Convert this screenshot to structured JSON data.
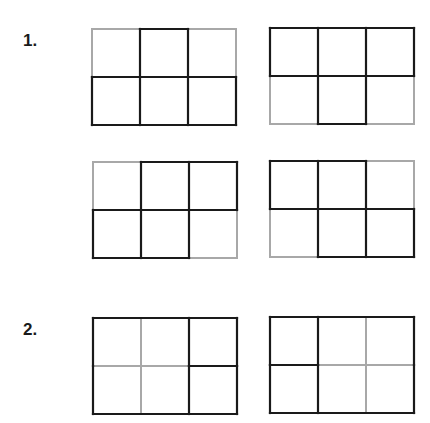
{
  "colors": {
    "dark": "#1a1a1a",
    "light": "#a8a8a8"
  },
  "problems": [
    {
      "label": "1.",
      "grids": [
        {
          "x": 92,
          "y": 29,
          "edges": {
            "h": [
              [
                "L",
                "D",
                "L"
              ],
              [
                "D",
                "D",
                "D"
              ],
              [
                "D",
                "D",
                "D"
              ]
            ],
            "v": [
              [
                "L",
                "D",
                "D",
                "L"
              ],
              [
                "D",
                "D",
                "D",
                "D"
              ]
            ]
          }
        },
        {
          "x": 270,
          "y": 28,
          "edges": {
            "h": [
              [
                "D",
                "D",
                "D"
              ],
              [
                "D",
                "D",
                "D"
              ],
              [
                "L",
                "D",
                "L"
              ]
            ],
            "v": [
              [
                "D",
                "D",
                "D",
                "D"
              ],
              [
                "L",
                "D",
                "D",
                "L"
              ]
            ]
          }
        },
        {
          "x": 93,
          "y": 162,
          "edges": {
            "h": [
              [
                "L",
                "D",
                "D"
              ],
              [
                "D",
                "D",
                "D"
              ],
              [
                "D",
                "D",
                "L"
              ]
            ],
            "v": [
              [
                "L",
                "D",
                "D",
                "D"
              ],
              [
                "D",
                "D",
                "D",
                "L"
              ]
            ]
          }
        },
        {
          "x": 270,
          "y": 161,
          "edges": {
            "h": [
              [
                "D",
                "D",
                "L"
              ],
              [
                "D",
                "D",
                "D"
              ],
              [
                "L",
                "D",
                "D"
              ]
            ],
            "v": [
              [
                "D",
                "D",
                "D",
                "L"
              ],
              [
                "L",
                "D",
                "D",
                "D"
              ]
            ]
          }
        }
      ]
    },
    {
      "label": "2.",
      "grids": [
        {
          "x": 93,
          "y": 318,
          "edges": {
            "h": [
              [
                "D",
                "D",
                "D"
              ],
              [
                "L",
                "L",
                "D"
              ],
              [
                "D",
                "D",
                "D"
              ]
            ],
            "v": [
              [
                "D",
                "L",
                "D",
                "D"
              ],
              [
                "D",
                "L",
                "D",
                "D"
              ]
            ]
          }
        },
        {
          "x": 270,
          "y": 317,
          "edges": {
            "h": [
              [
                "D",
                "D",
                "D"
              ],
              [
                "D",
                "L",
                "L"
              ],
              [
                "D",
                "D",
                "D"
              ]
            ],
            "v": [
              [
                "D",
                "D",
                "L",
                "D"
              ],
              [
                "D",
                "D",
                "L",
                "D"
              ]
            ]
          }
        }
      ]
    }
  ]
}
